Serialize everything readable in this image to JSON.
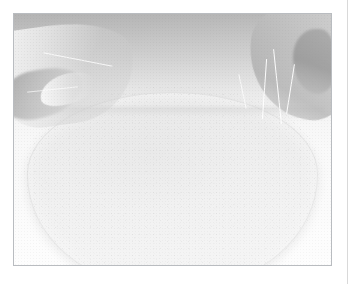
{
  "page": {
    "background_color": "#ffffff",
    "width": 355,
    "height": 284,
    "edge_rule_color": "#d9d9d9"
  },
  "photo": {
    "caption": "",
    "alt_description": "Faded overexposed photograph of two hands working a large pale rounded mass of dough on a light surface",
    "frame_border_color": "#b9bcc0",
    "base_color": "#f3f3f3",
    "subject_color": "#e4e4e4",
    "shadow_color": "#8a8a8a",
    "highlight_color": "#ffffff",
    "regions": [
      {
        "name": "upper-shadow-band",
        "label": ""
      },
      {
        "name": "left-hand",
        "label": ""
      },
      {
        "name": "right-hand",
        "label": ""
      },
      {
        "name": "dough-mass",
        "label": ""
      }
    ]
  }
}
